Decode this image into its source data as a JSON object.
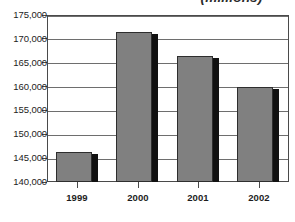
{
  "chart_data": {
    "type": "bar",
    "title": "(millions)",
    "xlabel": "",
    "ylabel": "",
    "categories": [
      "1999",
      "2000",
      "2001",
      "2002"
    ],
    "values": [
      146200,
      171500,
      166500,
      160000
    ],
    "ylim": [
      140000,
      175000
    ],
    "ytick_step": 5000,
    "ytick_labels": [
      "140,000",
      "145,000",
      "150,000",
      "155,000",
      "160,000",
      "165,000",
      "170,000",
      "175,000"
    ],
    "ytick_values": [
      140000,
      145000,
      150000,
      155000,
      160000,
      165000,
      170000,
      175000
    ],
    "grid": true,
    "legend": false,
    "legend_position": "none",
    "series": [
      {
        "name": "value",
        "values": [
          146200,
          171500,
          166500,
          160000
        ]
      }
    ],
    "colors": {
      "bar_fill": "#808080",
      "bar_outline": "#2e2e2e",
      "bar_shadow": "#111111",
      "gridline": "#6e6e6e",
      "frame": "#4a4a4a",
      "text": "#232323",
      "background": "#ffffff"
    }
  }
}
